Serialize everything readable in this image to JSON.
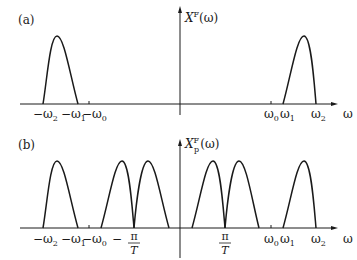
{
  "panels": {
    "a": {
      "tag": "(a)",
      "y_label": "X",
      "y_label_sup": "F",
      "y_label_arg": "(ω)",
      "x_label": "ω",
      "ticks": {
        "neg_w2": "−ω",
        "neg_w2_sub": "2",
        "neg_w1": "−ω",
        "neg_w1_sub": "1",
        "neg_w0": "−ω",
        "neg_w0_sub": "0",
        "w0": "ω",
        "w0_sub": "0",
        "w1": "ω",
        "w1_sub": "1",
        "w2": "ω",
        "w2_sub": "2"
      }
    },
    "b": {
      "tag": "(b)",
      "y_label": "X",
      "y_label_sup": "F",
      "y_label_sub": "p",
      "y_label_arg": "(ω)",
      "x_label": "ω",
      "ticks": {
        "neg_w2": "−ω",
        "neg_w2_sub": "2",
        "neg_w1": "−ω",
        "neg_w1_sub": "1",
        "neg_w0": "−ω",
        "neg_w0_sub": "0",
        "neg_pi_T_minus": "−",
        "pi": "π",
        "T": "T",
        "w0": "ω",
        "w0_sub": "0",
        "w1": "ω",
        "w1_sub": "1",
        "w2": "ω",
        "w2_sub": "2"
      }
    }
  },
  "colors": {
    "stroke": "#1a1a1a"
  }
}
